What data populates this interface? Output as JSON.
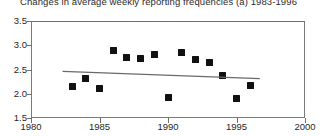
{
  "chart_data": {
    "type": "scatter",
    "title": "Changes in average weekly reporting frequencies (a) 1983-1996",
    "xlabel": "",
    "ylabel": "",
    "xlim": [
      1980,
      2000
    ],
    "ylim": [
      1.5,
      3.5
    ],
    "xticks": [
      1980,
      1985,
      1990,
      1995,
      2000
    ],
    "xtick_labels": [
      "1980",
      "1985",
      "1990",
      "1995",
      "2000"
    ],
    "yticks": [
      1.5,
      2.0,
      2.5,
      3.0,
      3.5
    ],
    "ytick_labels": [
      "1.5",
      "2.0",
      "2.5",
      "3.0",
      "3.5"
    ],
    "grid": false,
    "legend": "none",
    "marker_style": "filled-diamond",
    "marker_color": "#111111",
    "frame_color": "#7a7a7a",
    "trend_color": "#6a6a6a",
    "x": [
      1983,
      1984,
      1985,
      1986,
      1987,
      1988,
      1989,
      1990,
      1991,
      1992,
      1993,
      1994,
      1995,
      1996
    ],
    "values": [
      2.15,
      2.32,
      2.1,
      2.9,
      2.75,
      2.72,
      2.8,
      1.93,
      2.85,
      2.7,
      2.65,
      2.37,
      1.9,
      2.18
    ],
    "series": [
      {
        "name": "Average weekly reporting frequency",
        "points": [
          {
            "x": 1983,
            "y": 2.15
          },
          {
            "x": 1984,
            "y": 2.32
          },
          {
            "x": 1985,
            "y": 2.1
          },
          {
            "x": 1986,
            "y": 2.9
          },
          {
            "x": 1987,
            "y": 2.75
          },
          {
            "x": 1988,
            "y": 2.72
          },
          {
            "x": 1989,
            "y": 2.8
          },
          {
            "x": 1990,
            "y": 1.93
          },
          {
            "x": 1991,
            "y": 2.85
          },
          {
            "x": 1992,
            "y": 2.7
          },
          {
            "x": 1993,
            "y": 2.65
          },
          {
            "x": 1994,
            "y": 2.37
          },
          {
            "x": 1995,
            "y": 1.9
          },
          {
            "x": 1996,
            "y": 2.18
          }
        ]
      }
    ],
    "trend": {
      "name": "linear-trend",
      "x_start": 1982.3,
      "y_start": 2.46,
      "x_end": 2996,
      "x_end_value": 1996.7,
      "y_end": 2.31
    },
    "annotations": []
  }
}
